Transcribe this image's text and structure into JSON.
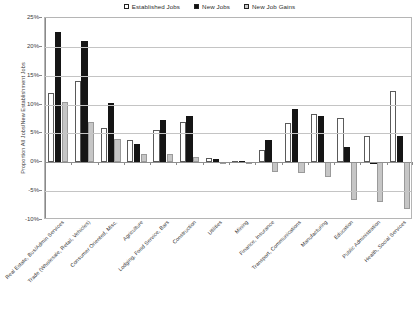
{
  "chart_data": {
    "type": "bar",
    "title": "",
    "xlabel": "",
    "ylabel": "Proportion All Jobs/New Establishment Jobs",
    "ylim": [
      -10,
      25
    ],
    "ytick_labels": [
      "25%",
      "20%",
      "15%",
      "10%",
      "5%",
      "0%",
      "-5%",
      "-10%"
    ],
    "ytick_values": [
      25,
      20,
      15,
      10,
      5,
      0,
      -5,
      -10
    ],
    "grid": true,
    "legend_position": "top-center",
    "categories": [
      "Real Estate, Bus/Admin Services",
      "Trade (Wholesale, Retail, Vehicles)",
      "Consumer Oriented, Misc.",
      "Agriculture",
      "Lodging, Food Service, Bars",
      "Construction",
      "Utilities",
      "Mining",
      "Finance, Insurance",
      "Transport, Communications",
      "Manufacturing",
      "Education",
      "Public Administration",
      "Health, Social Services"
    ],
    "series": [
      {
        "name": "Established Jobs",
        "color": "#ffffff",
        "values": [
          12.0,
          14.1,
          6.0,
          3.9,
          5.6,
          7.0,
          0.8,
          0.3,
          2.2,
          6.8,
          8.4,
          7.6,
          4.6,
          12.4
        ]
      },
      {
        "name": "New Jobs",
        "color": "#151515",
        "values": [
          22.5,
          21.1,
          10.2,
          3.1,
          7.3,
          8.1,
          0.5,
          0.3,
          3.9,
          9.3,
          8.0,
          2.6,
          0.1,
          4.5
        ]
      },
      {
        "name": "New Job Gains",
        "color": "#c6c6c6",
        "values": [
          10.5,
          7.0,
          4.1,
          1.5,
          1.5,
          1.0,
          -0.1,
          -0.1,
          -1.6,
          -1.8,
          -2.6,
          -6.6,
          -6.9,
          -8.1
        ]
      }
    ]
  },
  "legend": {
    "items": [
      {
        "label": "Established Jobs",
        "swatch": "swatch-established-jobs"
      },
      {
        "label": "New Jobs",
        "swatch": "swatch-new-jobs"
      },
      {
        "label": "New Job Gains",
        "swatch": "swatch-new-job-gains"
      }
    ]
  }
}
